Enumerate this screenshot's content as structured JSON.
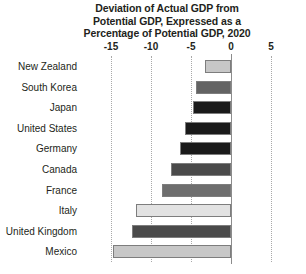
{
  "chart_data": {
    "type": "bar",
    "orientation": "horizontal",
    "title": "Deviation of Actual GDP from Potential GDP, Expressed as a Percentage of Potential GDP, 2020",
    "title_lines": [
      "Deviation of Actual GDP from",
      "Potential GDP, Expressed as a",
      "Percentage of Potential GDP, 2020"
    ],
    "xlabel": "",
    "ylabel": "",
    "xlim": [
      -17.5,
      6.5
    ],
    "xticks": [
      -15,
      -10,
      -5,
      0,
      5
    ],
    "xtick_labels": [
      "-15",
      "-10",
      "-5",
      "0",
      "5"
    ],
    "grid": "vertical-dotted",
    "legend": "none",
    "axis_position": "top",
    "categories": [
      "New Zealand",
      "South Korea",
      "Japan",
      "United States",
      "Germany",
      "Canada",
      "France",
      "Italy",
      "United Kingdom",
      "Mexico"
    ],
    "values": [
      -3.2,
      -4.4,
      -4.7,
      -5.7,
      -6.4,
      -7.5,
      -8.6,
      -11.9,
      -12.4,
      -14.8
    ],
    "bar_colors": [
      "#c7c7c7",
      "#636363",
      "#1a1a1a",
      "#1a1a1a",
      "#1a1a1a",
      "#4a4a4a",
      "#6e6e6e",
      "#e2e2e2",
      "#4a4a4a",
      "#c7c7c7"
    ],
    "bar_stroke": "#7d7d7d",
    "axis_color": "#8c8c8c",
    "gridline_color": "#a9a9a9",
    "text_color": "#231f20",
    "background": "#ffffff"
  }
}
